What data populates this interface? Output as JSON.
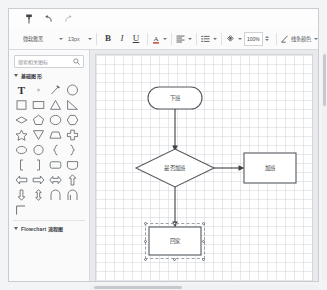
{
  "app": {
    "type": "flowchart-editor",
    "accent_color": "#4a90d9",
    "canvas_bg": "#ffffff",
    "shape_stroke": "#6b7075"
  },
  "toolbar_top": {
    "items": [
      {
        "name": "format-painter",
        "icon": "format-painter-icon",
        "enabled": true
      },
      {
        "name": "undo",
        "icon": "undo-icon",
        "enabled": true
      },
      {
        "name": "redo",
        "icon": "redo-icon",
        "enabled": false
      }
    ]
  },
  "toolbar_format": {
    "font_family": "微软雅黑",
    "font_size": "13px",
    "bold_label": "B",
    "italic_label": "I",
    "underline_label": "U",
    "font_color_label": "A",
    "align_icon": "align-left-icon",
    "list_icon": "bullet-list-icon",
    "fill_icon": "fill-color-icon",
    "zoom_value": "100%",
    "line_color_label": "线条颜色"
  },
  "sidebar": {
    "search": {
      "placeholder": "搜索相关图标",
      "icon": "search-icon",
      "value": ""
    },
    "groups": [
      {
        "name": "basic-shapes",
        "label": "基础图形",
        "expanded": true
      },
      {
        "name": "flowchart",
        "label": "Flowchart 流程图",
        "expanded": true
      }
    ],
    "shapes": [
      {
        "name": "text-tool",
        "glyph": "T"
      },
      {
        "name": "dot-shape",
        "glyph": "dot"
      },
      {
        "name": "pencil-line",
        "glyph": "pencil"
      },
      {
        "name": "circle-shape",
        "glyph": "circle"
      },
      {
        "name": "square-shape",
        "glyph": "square"
      },
      {
        "name": "rectangle-shape",
        "glyph": "rect"
      },
      {
        "name": "triangle-shape",
        "glyph": "triangle"
      },
      {
        "name": "right-triangle-shape",
        "glyph": "right-triangle"
      },
      {
        "name": "diamond-shape",
        "glyph": "diamond"
      },
      {
        "name": "pentagon-shape",
        "glyph": "pentagon"
      },
      {
        "name": "ellipse-shape",
        "glyph": "ellipse"
      },
      {
        "name": "hexagon-shape",
        "glyph": "hexagon"
      },
      {
        "name": "star-shape",
        "glyph": "star"
      },
      {
        "name": "inverted-triangle-shape",
        "glyph": "inv-triangle"
      },
      {
        "name": "trapezoid-shape",
        "glyph": "trapezoid"
      },
      {
        "name": "cross-shape",
        "glyph": "cross"
      },
      {
        "name": "oval-shape",
        "glyph": "oval"
      },
      {
        "name": "circle-outline-shape",
        "glyph": "circle2"
      },
      {
        "name": "left-brace-shape",
        "glyph": "brace-left"
      },
      {
        "name": "right-brace-shape",
        "glyph": "brace-right"
      },
      {
        "name": "left-bracket-shape",
        "glyph": "bracket-left"
      },
      {
        "name": "right-bracket-shape",
        "glyph": "bracket-right"
      },
      {
        "name": "rounded-rect-shape",
        "glyph": "round-rect"
      },
      {
        "name": "shield-shape",
        "glyph": "shield"
      },
      {
        "name": "arrow-left-shape",
        "glyph": "arrow-left"
      },
      {
        "name": "arrow-right-shape",
        "glyph": "arrow-right"
      },
      {
        "name": "arrow-double-shape",
        "glyph": "arrow-double"
      },
      {
        "name": "arrow-up-shape",
        "glyph": "arrow-up"
      },
      {
        "name": "arrow-down-shape",
        "glyph": "arrow-down"
      },
      {
        "name": "arrow-updown-shape",
        "glyph": "arrow-updown"
      },
      {
        "name": "arc-shape",
        "glyph": "arc"
      },
      {
        "name": "arc2-shape",
        "glyph": "arc2"
      },
      {
        "name": "elbow-connector-shape",
        "glyph": "elbow"
      }
    ]
  },
  "canvas": {
    "nodes": [
      {
        "id": "start",
        "name": "node-start",
        "label": "下班",
        "shape": "terminator",
        "x": 52,
        "y": 32,
        "w": 54,
        "h": 22,
        "selected": false
      },
      {
        "id": "decision",
        "name": "node-decision",
        "label": "是否加班",
        "shape": "diamond",
        "x": 40,
        "y": 94,
        "w": 78,
        "h": 38,
        "selected": false
      },
      {
        "id": "overtime",
        "name": "node-overtime",
        "label": "加班",
        "shape": "process",
        "x": 148,
        "y": 98,
        "w": 52,
        "h": 30,
        "selected": false
      },
      {
        "id": "home",
        "name": "node-home",
        "label": "回家",
        "shape": "process",
        "x": 53,
        "y": 172,
        "w": 52,
        "h": 28,
        "selected": true
      }
    ],
    "connectors": [
      {
        "name": "connector-start-to-decision",
        "from": "start",
        "to": "decision",
        "direction": "down"
      },
      {
        "name": "connector-decision-to-overtime",
        "from": "decision",
        "to": "overtime",
        "direction": "right"
      },
      {
        "name": "connector-decision-to-home",
        "from": "decision",
        "to": "home",
        "direction": "down"
      }
    ]
  },
  "scrollbars": {
    "vertical": {
      "name": "vertical-scrollbar"
    },
    "horizontal": {
      "name": "horizontal-scrollbar"
    }
  }
}
